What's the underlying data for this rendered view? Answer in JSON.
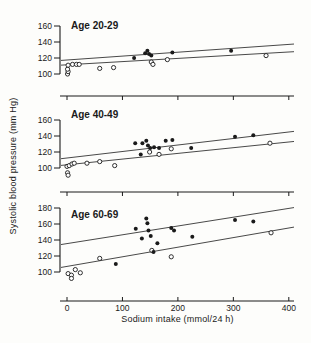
{
  "figure": {
    "xlabel": "Sodium intake (mmol/24 h)",
    "ylabel": "Systolic blood pressure (mm Hg)"
  },
  "colors": {
    "ink": "#1a1a1a",
    "background": "#fdfdfb",
    "open_marker_fill": "#ffffff"
  },
  "chart_data": {
    "type": "scatter",
    "xlabel": "Sodium intake (mmol/24 h)",
    "ylabel": "Systolic blood pressure (mm Hg)",
    "xlim": [
      0,
      400
    ],
    "xticks": [
      0,
      100,
      200,
      300,
      400
    ],
    "grid": false,
    "legend": "none",
    "panels": [
      {
        "label": "Age 20-29",
        "ylim": [
          100,
          160
        ],
        "yticks": [
          100,
          120,
          140,
          160
        ],
        "series": [
          {
            "name": "open-circles",
            "marker": "open",
            "points": [
              [
                1,
                100
              ],
              [
                2,
                103
              ],
              [
                1,
                106
              ],
              [
                2,
                111
              ],
              [
                10,
                112
              ],
              [
                17,
                112
              ],
              [
                22,
                112
              ],
              [
                59,
                107
              ],
              [
                84,
                108
              ],
              [
                152,
                115
              ],
              [
                155,
                112
              ],
              [
                181,
                118
              ],
              [
                359,
                123
              ]
            ]
          },
          {
            "name": "filled-circles",
            "marker": "filled",
            "points": [
              [
                121,
                120
              ],
              [
                141,
                126
              ],
              [
                145,
                129
              ],
              [
                148,
                125
              ],
              [
                152,
                123
              ],
              [
                190,
                127
              ],
              [
                296,
                129
              ]
            ]
          }
        ],
        "lines": [
          {
            "name": "upper-regression",
            "x": [
              0,
              400
            ],
            "y": [
              117.5,
              137
            ]
          },
          {
            "name": "lower-regression",
            "x": [
              0,
              400
            ],
            "y": [
              111.5,
              127.5
            ]
          }
        ]
      },
      {
        "label": "Age 40-49",
        "ylim": [
          100,
          160
        ],
        "yticks": [
          100,
          120,
          140,
          160
        ],
        "series": [
          {
            "name": "open-circles",
            "marker": "open",
            "points": [
              [
                1,
                94
              ],
              [
                2,
                91
              ],
              [
                0,
                102
              ],
              [
                4,
                103
              ],
              [
                9,
                105
              ],
              [
                13,
                106
              ],
              [
                36,
                106
              ],
              [
                59,
                108
              ],
              [
                86,
                103
              ],
              [
                149,
                120
              ],
              [
                166,
                117
              ],
              [
                188,
                124
              ],
              [
                366,
                131
              ]
            ]
          },
          {
            "name": "filled-circles",
            "marker": "filled",
            "points": [
              [
                123,
                131
              ],
              [
                133,
                117
              ],
              [
                136,
                131
              ],
              [
                143,
                134
              ],
              [
                146,
                128
              ],
              [
                150,
                125
              ],
              [
                157,
                126
              ],
              [
                166,
                125
              ],
              [
                178,
                134
              ],
              [
                190,
                135
              ],
              [
                224,
                125
              ],
              [
                303,
                139
              ],
              [
                336,
                141
              ]
            ]
          }
        ],
        "lines": [
          {
            "name": "upper-regression",
            "x": [
              0,
              400
            ],
            "y": [
              112.5,
              145
            ]
          },
          {
            "name": "lower-regression",
            "x": [
              0,
              400
            ],
            "y": [
              104,
              132.5
            ]
          }
        ]
      },
      {
        "label": "Age 60-69",
        "ylim": [
          100,
          180
        ],
        "yticks": [
          100,
          120,
          140,
          160,
          180
        ],
        "series": [
          {
            "name": "open-circles",
            "marker": "open",
            "points": [
              [
                2,
                98
              ],
              [
                8,
                96
              ],
              [
                8,
                92
              ],
              [
                15,
                103
              ],
              [
                24,
                99
              ],
              [
                59,
                117
              ],
              [
                153,
                127
              ],
              [
                188,
                119
              ],
              [
                368,
                149
              ]
            ]
          },
          {
            "name": "filled-circles",
            "marker": "filled",
            "points": [
              [
                88,
                110
              ],
              [
                124,
                154
              ],
              [
                135,
                142
              ],
              [
                143,
                167
              ],
              [
                145,
                161
              ],
              [
                147,
                152
              ],
              [
                151,
                145
              ],
              [
                156,
                125
              ],
              [
                163,
                136
              ],
              [
                188,
                155
              ],
              [
                193,
                152
              ],
              [
                226,
                144
              ],
              [
                303,
                165
              ],
              [
                336,
                163
              ]
            ]
          }
        ],
        "lines": [
          {
            "name": "upper-regression",
            "x": [
              0,
              400
            ],
            "y": [
              135.5,
              179.5
            ]
          },
          {
            "name": "lower-regression",
            "x": [
              0,
              400
            ],
            "y": [
              107,
              155
            ]
          }
        ]
      }
    ]
  }
}
